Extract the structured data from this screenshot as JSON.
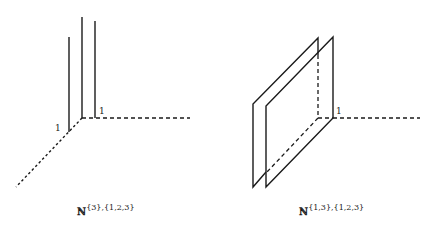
{
  "figures": [
    {
      "id": "left",
      "caption": {
        "base": "ℕ",
        "superscript": "{3},{1,2,3}"
      },
      "tick_labels": {
        "x_axis": "1",
        "diag_axis": "1"
      },
      "description": "Three vertical lines (fibers) over points of the lattice, dashed axes in perspective"
    },
    {
      "id": "right",
      "caption": {
        "base": "ℕ",
        "superscript": "{1,3},{1,2,3}"
      },
      "tick_labels": {
        "x_axis": "1"
      },
      "description": "Two parallel planes (parallelograms) in perspective with dashed axes"
    }
  ],
  "colors": {
    "ink": "#1a1a1a",
    "background": "#ffffff"
  }
}
